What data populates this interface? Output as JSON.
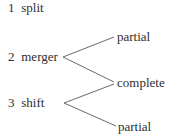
{
  "diagram": {
    "type": "branching-tree",
    "stroke_color": "#6a6a6a",
    "text_color": "#2e2e2e",
    "items": [
      {
        "number": "1",
        "label": "split"
      },
      {
        "number": "2",
        "label": "merger"
      },
      {
        "number": "3",
        "label": "shift"
      }
    ],
    "outcomes": [
      {
        "label": "partial"
      },
      {
        "label": "complete"
      },
      {
        "label": "partial"
      }
    ],
    "edges": [
      {
        "from": "merger",
        "to": "partial (top)"
      },
      {
        "from": "merger",
        "to": "complete"
      },
      {
        "from": "shift",
        "to": "complete"
      },
      {
        "from": "shift",
        "to": "partial (bottom)"
      }
    ]
  }
}
